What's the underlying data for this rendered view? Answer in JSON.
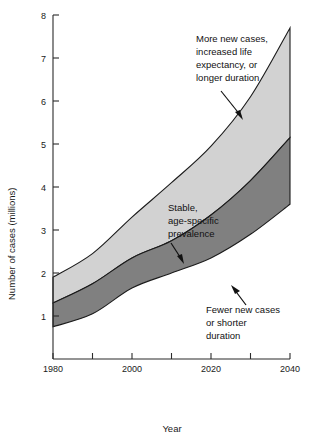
{
  "chart_data": {
    "type": "area",
    "title": "",
    "xlabel": "Year",
    "ylabel": "Number of cases (millions)",
    "xlim": [
      1980,
      2040
    ],
    "ylim": [
      0,
      8
    ],
    "grid": false,
    "legend_position": "inline-annotations",
    "x_ticks": [
      1980,
      1990,
      2000,
      2010,
      2020,
      2030,
      2040
    ],
    "x_tick_labels": [
      "1980",
      "",
      "2000",
      "",
      "2020",
      "",
      "2040"
    ],
    "y_ticks": [
      1,
      2,
      3,
      4,
      5,
      6,
      7,
      8
    ],
    "y_tick_labels": [
      "1",
      "2",
      "3",
      "4",
      "5",
      "6",
      "7",
      "8"
    ],
    "x": [
      1980,
      1990,
      2000,
      2010,
      2020,
      2030,
      2040
    ],
    "series": [
      {
        "name": "More new cases, increased life expectancy, or longer duration",
        "role": "upper-bound",
        "values": [
          1.9,
          2.45,
          3.3,
          4.1,
          4.95,
          6.1,
          7.7
        ],
        "color": "#d2d2d2"
      },
      {
        "name": "Stable, age-specific prevalence",
        "role": "central-estimate",
        "values": [
          1.3,
          1.75,
          2.35,
          2.75,
          3.35,
          4.15,
          5.15
        ],
        "color": "#808080"
      },
      {
        "name": "Fewer new cases or shorter duration",
        "role": "lower-bound",
        "values": [
          0.75,
          1.05,
          1.65,
          2.0,
          2.35,
          2.9,
          3.6
        ],
        "color": "#ffffff"
      }
    ],
    "annotations": [
      {
        "id": "upper-annotation",
        "lines": [
          "More new cases,",
          "increased life",
          "expectancy, or",
          "longer duration"
        ],
        "arrow_from": [
          2017,
          6.6
        ],
        "arrow_to": [
          2026,
          5.85
        ]
      },
      {
        "id": "middle-annotation",
        "lines": [
          "Stable,",
          "age-specific",
          "prevalence"
        ],
        "arrow_from": [
          2011,
          4.1
        ],
        "arrow_to": [
          2015.5,
          3.1
        ]
      },
      {
        "id": "lower-annotation",
        "lines": [
          "Fewer new cases",
          "or shorter",
          "duration"
        ],
        "arrow_from": [
          2029.5,
          2.45
        ],
        "arrow_to": [
          2025,
          2.85
        ]
      }
    ]
  },
  "axes": {
    "y_title": "Number of cases (millions)",
    "x_title": "Year",
    "x_tick_labels": [
      "1980",
      "2000",
      "2020",
      "2040"
    ],
    "y_tick_labels": [
      "8",
      "7",
      "6",
      "5",
      "4",
      "3",
      "2",
      "1"
    ]
  },
  "annotations": {
    "upper": {
      "line1": "More new cases,",
      "line2": "increased life",
      "line3": "expectancy, or",
      "line4": "longer duration"
    },
    "middle": {
      "line1": "Stable,",
      "line2": "age-specific",
      "line3": "prevalence"
    },
    "lower": {
      "line1": "Fewer new cases",
      "line2": "or shorter",
      "line3": "duration"
    }
  },
  "colors": {
    "upper_band": "#d2d2d2",
    "lower_band": "#808080",
    "outline": "#1b1b1b",
    "text": "#111111",
    "background": "#ffffff"
  }
}
